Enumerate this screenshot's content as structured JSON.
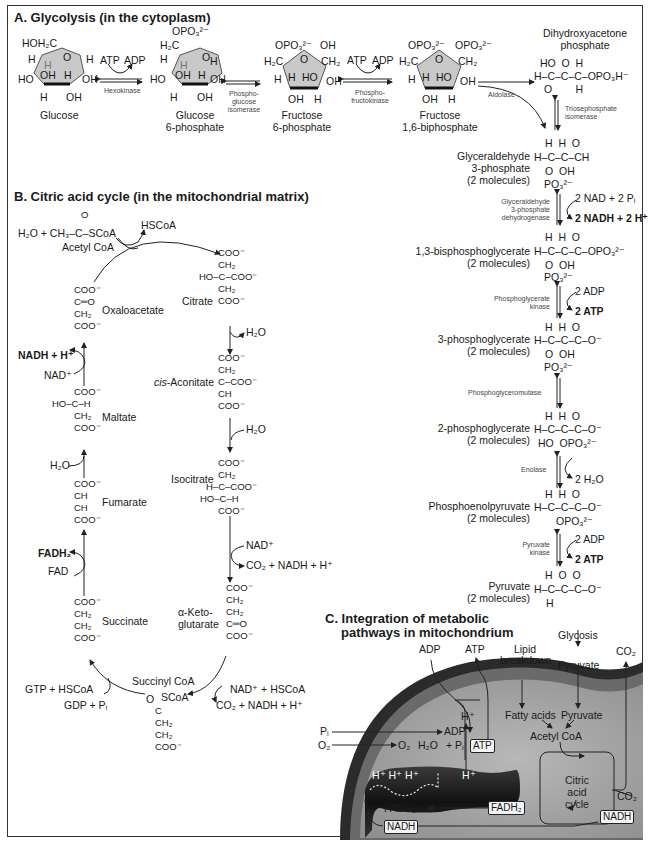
{
  "sections": {
    "a_title": "A. Glycolysis (in the cytoplasm)",
    "b_title": "B. Citric acid cycle  (in the mitochondrial matrix)",
    "c_title_line1": "C. Integration of metabolic",
    "c_title_line2": "pathways in mitochondrium"
  },
  "glycolysis": {
    "glucose": {
      "name": "Glucose",
      "top": "HOH₂C",
      "labels": [
        "H",
        "H",
        "O",
        "H",
        "HO",
        "OH",
        "H",
        "OH",
        "H",
        "OH"
      ]
    },
    "g6p": {
      "name_line1": "Glucose",
      "name_line2": "6-phosphate",
      "top": "OPO₃²⁻",
      "ch2": "H₂C"
    },
    "f6p": {
      "name_line1": "Fructose",
      "name_line2": "6-phosphate",
      "top": "OPO₃²⁻",
      "ch2": "H₂C",
      "right_top": "OH",
      "right_ch2": "CH₂"
    },
    "f16bp": {
      "name_line1": "Fructose",
      "name_line2": "1,6-biphosphate",
      "top_left": "OPO₃²⁻",
      "top_right": "OPO₃²⁻",
      "ch2_left": "H₂C",
      "ch2_right": "CH₂"
    },
    "dhap": {
      "name_line1": "Dihydroxyacetone",
      "name_line2": "phosphate",
      "formula_row1": "HO  O  H",
      "formula_row2": "H–C–C–C–OPO₃H⁻",
      "formula_row3": "O        H"
    },
    "enzymes": {
      "hexokinase": "Hexokinase",
      "pgi_1": "Phospho-",
      "pgi_2": "glucose",
      "pgi_3": "isomerase",
      "pfk_1": "Phospho-",
      "pfk_2": "fructokinase",
      "aldolase": "Aldolase",
      "tpi_1": "Triosephosphate",
      "tpi_2": "isomerase",
      "gapdh_1": "Glyceraldehyde",
      "gapdh_2": "3-phosphate",
      "gapdh_3": "dehydrogenase",
      "pgk_1": "Phosphoglycerate",
      "pgk_2": "kinase",
      "pgm": "Phosphoglyceromutase",
      "enolase": "Enolase",
      "pk_1": "Pyruvate",
      "pk_2": "kinase"
    },
    "cofactors": {
      "atp1": "ATP",
      "adp1": "ADP",
      "atp2": "ATP",
      "adp2": "ADP",
      "nad_in": "2 NAD + 2 Pᵢ",
      "nadh_out": "2 NADH + 2 H⁺",
      "pgk_adp": "2 ADP",
      "pgk_atp": "2 ATP",
      "enolase_water": "2 H₂O",
      "pk_adp": "2 ADP",
      "pk_atp": "2 ATP"
    },
    "vertical_steps": [
      {
        "name1": "Glyceraldehyde",
        "name2": "3-phosphate",
        "name3": "(2 molecules)",
        "row0": "H  H  O",
        "row1": "H–C–C–CH",
        "row2": "O  OH",
        "row3": "PO₃²⁻"
      },
      {
        "name1": "1,3-bisphosphoglycerate",
        "name2": "(2 molecules)",
        "row0": "H  H  O",
        "row1": "H–C–C–C–OPO₃²⁻",
        "row2": "O  OH",
        "row3": "PO₃²⁻"
      },
      {
        "name1": "3-phosphoglycerate",
        "name2": "(2 molecules)",
        "row0": "H  H  O",
        "row1": "H–C–C–C–O⁻",
        "row2": "O  OH",
        "row3": "PO₃²⁻"
      },
      {
        "name1": "2-phosphoglycerate",
        "name2": "(2 molecules)",
        "row0": "H  H  O",
        "row1": "H–C–C–C–O⁻",
        "row2": "HO  OPO₃²⁻"
      },
      {
        "name1": "Phosphoenolpyruvate",
        "name2": "(2 molecules)",
        "row0": "H  H  O",
        "row1": "H–C–C–C–O⁻",
        "row2": "OPO₃²⁻"
      },
      {
        "name1": "Pyruvate",
        "name2": "(2 molecules)",
        "row0": "H  O  O",
        "row1": "H–C–C–C–O⁻",
        "row2": "H"
      }
    ]
  },
  "citric_acid_cycle": {
    "acetyl_coa": {
      "prefix": "H₂O  +  CH₃–C–SCoA",
      "o": "O",
      "name": "Acetyl CoA"
    },
    "hscoa_out": "HSCoA",
    "citrate": {
      "name": "Citrate",
      "lines": [
        "COO⁻",
        "CH₂",
        "HO–C–COO⁻",
        "CH₂",
        "COO⁻"
      ]
    },
    "h2o_1": "H₂O",
    "cis_aconitate": {
      "name_italic": "cis",
      "name_rest": "-Aconitate",
      "lines": [
        "COO⁻",
        "CH₂",
        "C–COO⁻",
        "CH",
        "COO⁻"
      ]
    },
    "h2o_2": "H₂O",
    "isocitrate": {
      "name": "Isocitrate",
      "lines": [
        "COO⁻",
        "CH₂",
        "H–C–COO⁻",
        "HO–C–H",
        "COO⁻"
      ]
    },
    "idh_nad": "NAD⁺",
    "idh_out": "CO₂ + NADH + H⁺",
    "akg": {
      "name1": "α-Keto-",
      "name2": "glutarate",
      "lines": [
        "COO⁻",
        "CH₂",
        "CH₂",
        "C═O",
        "COO⁻"
      ]
    },
    "akgdh_in": "NAD⁺ + HSCoA",
    "akgdh_out": "CO₂ + NADH + H⁺",
    "succinyl_coa": {
      "name": "Succinyl CoA",
      "o": "O",
      "scoa": "SCoA",
      "lines": [
        "C",
        "CH₂",
        "CH₂",
        "COO⁻"
      ]
    },
    "scs_out": "GTP + HSCoA",
    "scs_in": "GDP + Pᵢ",
    "succinate": {
      "name": "Succinate",
      "lines": [
        "COO⁻",
        "CH₂",
        "CH₂",
        "COO⁻"
      ]
    },
    "sdh_out": "FADH₂",
    "sdh_in": "FAD",
    "fumarate": {
      "name": "Fumarate",
      "lines": [
        "COO⁻",
        "CH",
        "CH",
        "COO⁻"
      ]
    },
    "fum_in": "H₂O",
    "malate": {
      "name": "Maltate",
      "lines": [
        "COO⁻",
        "HO–C–H",
        "CH₂",
        "COO⁻"
      ]
    },
    "mdh_out": "NADH + H⁺",
    "mdh_in": "NAD⁺",
    "oxaloacetate": {
      "name": "Oxaloacetate",
      "lines": [
        "COO⁻",
        "C═O",
        "CH₂",
        "COO⁻"
      ]
    }
  },
  "mitochondrion": {
    "adp": "ADP",
    "atp": "ATP",
    "lipid1": "Lipid",
    "lipid2": "breakdown",
    "glycosis": "Glycosis",
    "pyruvate_out": "Pyruvate",
    "co2_top": "CO₂",
    "fatty_acids": "Fatty acids",
    "pyruvate_in": "Pyruvate",
    "acetyl_coa": "Acetyl CoA",
    "h_plus_up": "H⁺",
    "pi": "Pᵢ",
    "o2_in": "O₂",
    "adp_pi_1": "ADP",
    "adp_pi_2": "+ Pᵢ",
    "atp_box": "ATP",
    "o2_inner": "O₂",
    "h2o_inner": "H₂O",
    "h_plus_row": "H⁺ H⁺ H⁺",
    "h_plus_synth": "H⁺",
    "e_minus": "e⁻",
    "fadh2_inner": "FADH₂",
    "fadh2_box": "FADH₂",
    "cycle_1": "Citric",
    "cycle_2": "acid",
    "cycle_3": "cycle",
    "co2_out": "CO₂",
    "nadh_box": "NADH",
    "nadh_box_left": "NADH"
  },
  "colors": {
    "ring_fill": "#c9c9c9",
    "matrix": "#a9a9a9",
    "membrane_dark": "#2b2b2b",
    "crista": "#1e1e1e",
    "outer": "#6a6a6a"
  }
}
